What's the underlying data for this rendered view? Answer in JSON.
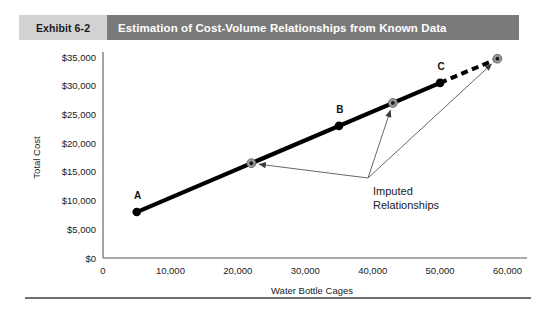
{
  "header": {
    "exhibit_label": "Exhibit 6-2",
    "title": "Estimation of Cost-Volume Relationships from Known Data"
  },
  "chart_data": {
    "type": "line",
    "title": "Estimation of Cost-Volume Relationships from Known Data",
    "xlabel": "Water Bottle Cages",
    "ylabel": "Total Cost",
    "xlim": [
      0,
      62000
    ],
    "ylim": [
      0,
      35000
    ],
    "grid": false,
    "legend": "none",
    "xticks": [
      0,
      10000,
      20000,
      30000,
      40000,
      50000,
      60000
    ],
    "xtick_labels": [
      "0",
      "10,000",
      "20,000",
      "30,000",
      "40,000",
      "50,000",
      "60,000"
    ],
    "yticks": [
      0,
      5000,
      10000,
      15000,
      20000,
      25000,
      30000,
      35000
    ],
    "ytick_labels": [
      "$0",
      "$5,000",
      "$10,000",
      "$15,000",
      "$20,000",
      "$25,000",
      "$30,000",
      "$35,000"
    ],
    "series": [
      {
        "name": "Known cost line",
        "style": "solid",
        "color": "#000000",
        "x": [
          5000,
          50000
        ],
        "y": [
          8000,
          30500
        ]
      },
      {
        "name": "Extrapolated cost line",
        "style": "dashed",
        "color": "#000000",
        "x": [
          50000,
          58500
        ],
        "y": [
          30500,
          34700
        ]
      }
    ],
    "known_points": [
      {
        "label": "A",
        "x": 5000,
        "y": 8000
      },
      {
        "label": "B",
        "x": 35000,
        "y": 23000
      },
      {
        "label": "C",
        "x": 50000,
        "y": 30500
      }
    ],
    "imputed_points": [
      {
        "label": "",
        "x": 22000,
        "y": 16500
      },
      {
        "label": "",
        "x": 43000,
        "y": 27000
      },
      {
        "label": "",
        "x": 58500,
        "y": 34700
      }
    ],
    "annotations": [
      {
        "text_line_1": "Imputed",
        "text_line_2": "Relationships",
        "points_to": [
          "imputed-point-1",
          "imputed-point-2",
          "imputed-point-3"
        ]
      }
    ]
  }
}
